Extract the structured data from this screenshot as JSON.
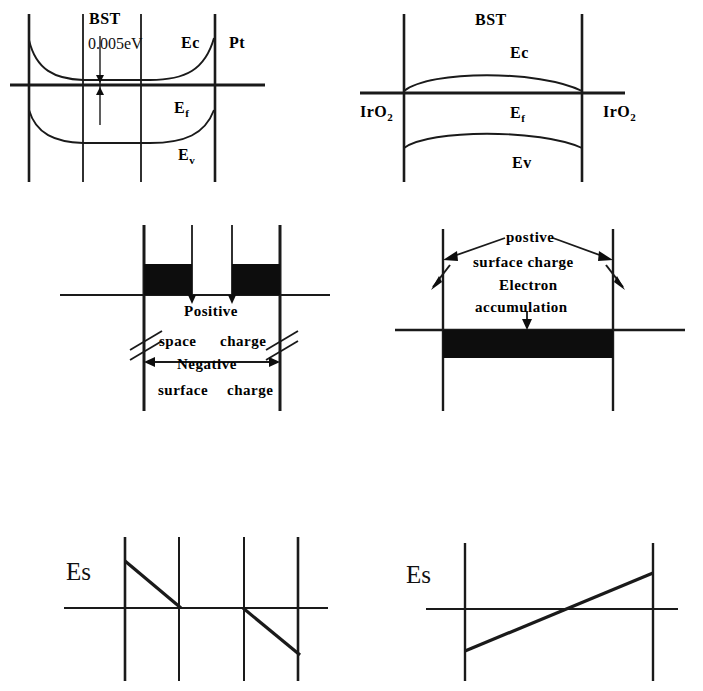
{
  "figure": {
    "background_color": "#ffffff",
    "line_color": "#1a1a1a",
    "fill_color": "#0d0d0d"
  },
  "panels": {
    "top_left": {
      "name": "BST with Pt electrode band diagram",
      "labels": {
        "material": "BST",
        "energy_gap": "0.005eV",
        "conduction_band": "Ec",
        "fermi_level": "E",
        "fermi_sub": "f",
        "valence_band": "E",
        "valence_sub": "v",
        "electrode_right": "Pt"
      }
    },
    "top_right": {
      "name": "BST with IrO2 electrodes band diagram",
      "labels": {
        "material": "BST",
        "conduction_band": "Ec",
        "fermi_level": "E",
        "fermi_sub": "f",
        "valence_band": "Ev",
        "electrode_left": "IrO",
        "electrode_left_sub": "2",
        "electrode_right": "IrO",
        "electrode_right_sub": "2"
      }
    },
    "middle_left": {
      "name": "Positive space charge and negative surface charge distribution",
      "labels": {
        "line1": "Positive",
        "line2_a": "space",
        "line2_b": "charge",
        "line3": "Negative",
        "line4_a": "surface",
        "line4_b": "charge"
      }
    },
    "middle_right": {
      "name": "Positive surface charge and electron accumulation distribution",
      "labels": {
        "line1": "postive",
        "line2": "surface charge",
        "line3": "Electron",
        "line4": "accumulation"
      }
    },
    "bottom_left": {
      "name": "Electric field profile for Pt electrode case",
      "labels": {
        "field": "Es"
      }
    },
    "bottom_right": {
      "name": "Electric field profile for IrO2 electrode case",
      "labels": {
        "field": "Es"
      }
    }
  }
}
